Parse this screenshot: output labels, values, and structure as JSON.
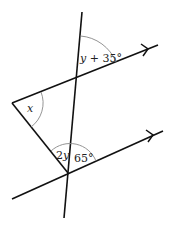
{
  "diagram": {
    "labels": {
      "upper_angle": "y + 35°",
      "lower_left_angle": "2y",
      "lower_right_angle": "65°",
      "triangle_angle": "x"
    },
    "colors": {
      "line": "#111111",
      "arc": "#888888"
    },
    "points": {
      "transversal_top": [
        82,
        12
      ],
      "transversal_bottom": [
        64,
        218
      ],
      "upper_parallel_start": [
        12,
        103
      ],
      "upper_parallel_end": [
        158,
        45
      ],
      "lower_parallel_start": [
        12,
        199
      ],
      "lower_parallel_end": [
        163,
        131
      ],
      "triangle_left_vertex": [
        12,
        103
      ],
      "triangle_bottom_vertex": [
        68,
        173
      ],
      "upper_intersection": [
        77,
        78
      ]
    }
  }
}
